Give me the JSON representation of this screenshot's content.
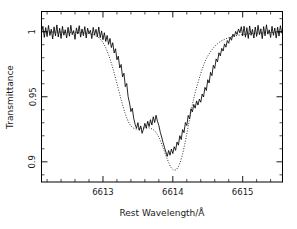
{
  "figure": {
    "background": "#ffffff",
    "foreground": "#000000"
  },
  "chart_data": {
    "type": "line",
    "title": "",
    "subtitle": "",
    "xlabel": "Rest Wavelength/Å",
    "ylabel": "Transmittance",
    "xlim": [
      6612.12,
      6615.57
    ],
    "ylim": [
      0.8845,
      1.0155
    ],
    "grid": false,
    "legend": null,
    "legend_position": "none",
    "xticks": [
      6613,
      6614,
      6615
    ],
    "xticklabels": [
      "6613",
      "6614",
      "6615"
    ],
    "xminor_tick_step": 0.2,
    "yticks": [
      0.9,
      0.95,
      1.0
    ],
    "yticklabels": [
      "0.9",
      "0.95",
      "1"
    ],
    "yminor_tick_step": 0.01,
    "annotations": [],
    "series": [
      {
        "name": "observed spectrum",
        "style": "solid",
        "color": "#000000",
        "x": [
          6612.12,
          6612.14,
          6612.16,
          6612.18,
          6612.2,
          6612.22,
          6612.24,
          6612.26,
          6612.28,
          6612.3,
          6612.32,
          6612.34,
          6612.36,
          6612.38,
          6612.4,
          6612.42,
          6612.44,
          6612.46,
          6612.48,
          6612.5,
          6612.52,
          6612.54,
          6612.56,
          6612.58,
          6612.6,
          6612.62,
          6612.64,
          6612.66,
          6612.68,
          6612.7,
          6612.72,
          6612.74,
          6612.76,
          6612.78,
          6612.8,
          6612.82,
          6612.84,
          6612.86,
          6612.88,
          6612.9,
          6612.92,
          6612.94,
          6612.96,
          6612.98,
          6613.0,
          6613.02,
          6613.04,
          6613.06,
          6613.08,
          6613.1,
          6613.12,
          6613.14,
          6613.16,
          6613.18,
          6613.2,
          6613.22,
          6613.24,
          6613.26,
          6613.28,
          6613.3,
          6613.32,
          6613.34,
          6613.36,
          6613.38,
          6613.4,
          6613.42,
          6613.44,
          6613.46,
          6613.48,
          6613.5,
          6613.52,
          6613.54,
          6613.56,
          6613.58,
          6613.6,
          6613.62,
          6613.64,
          6613.66,
          6613.68,
          6613.7,
          6613.72,
          6613.74,
          6613.76,
          6613.78,
          6613.8,
          6613.82,
          6613.84,
          6613.86,
          6613.88,
          6613.9,
          6613.92,
          6613.94,
          6613.96,
          6613.98,
          6614.0,
          6614.02,
          6614.04,
          6614.06,
          6614.08,
          6614.1,
          6614.12,
          6614.14,
          6614.16,
          6614.18,
          6614.2,
          6614.22,
          6614.24,
          6614.26,
          6614.28,
          6614.3,
          6614.32,
          6614.34,
          6614.36,
          6614.38,
          6614.4,
          6614.42,
          6614.44,
          6614.46,
          6614.48,
          6614.5,
          6614.52,
          6614.54,
          6614.56,
          6614.58,
          6614.6,
          6614.62,
          6614.64,
          6614.66,
          6614.68,
          6614.7,
          6614.72,
          6614.74,
          6614.76,
          6614.78,
          6614.8,
          6614.82,
          6614.84,
          6614.86,
          6614.88,
          6614.9,
          6614.92,
          6614.94,
          6614.96,
          6614.98,
          6615.0,
          6615.02,
          6615.04,
          6615.06,
          6615.08,
          6615.1,
          6615.12,
          6615.14,
          6615.16,
          6615.18,
          6615.2,
          6615.22,
          6615.24,
          6615.26,
          6615.28,
          6615.3,
          6615.32,
          6615.34,
          6615.36,
          6615.38,
          6615.4,
          6615.42,
          6615.44,
          6615.46,
          6615.48,
          6615.5,
          6615.52,
          6615.54,
          6615.56
        ],
        "y": [
          0.9995,
          1.0042,
          0.9956,
          1.0031,
          0.9962,
          1.0048,
          0.9971,
          1.0019,
          0.9944,
          1.0037,
          0.9968,
          1.0052,
          0.9959,
          1.0026,
          0.9948,
          1.0041,
          0.9973,
          1.0015,
          0.9952,
          1.0034,
          0.9965,
          1.0049,
          0.9977,
          1.0008,
          0.9941,
          1.0029,
          0.9982,
          1.0046,
          0.9958,
          1.0021,
          0.9969,
          1.0039,
          0.9951,
          1.0027,
          0.9985,
          1.0011,
          0.9947,
          1.0033,
          0.9974,
          1.0018,
          0.9961,
          1.0036,
          0.9954,
          1.0006,
          0.9938,
          0.9992,
          0.9925,
          0.9971,
          0.9902,
          0.9948,
          0.9878,
          0.9915,
          0.9836,
          0.9869,
          0.9784,
          0.9812,
          0.9721,
          0.9748,
          0.9652,
          0.9681,
          0.9578,
          0.9602,
          0.9501,
          0.9452,
          0.9386,
          0.9412,
          0.9334,
          0.9288,
          0.9258,
          0.9301,
          0.9242,
          0.9276,
          0.9219,
          0.9252,
          0.9296,
          0.9258,
          0.9312,
          0.9271,
          0.9324,
          0.9283,
          0.9346,
          0.9302,
          0.9358,
          0.9312,
          0.9279,
          0.9228,
          0.9191,
          0.9148,
          0.9112,
          0.9076,
          0.9042,
          0.9087,
          0.9051,
          0.9098,
          0.9064,
          0.9116,
          0.9088,
          0.9152,
          0.9128,
          0.9201,
          0.9171,
          0.9248,
          0.9224,
          0.9302,
          0.9279,
          0.9356,
          0.9331,
          0.9408,
          0.9384,
          0.9441,
          0.9412,
          0.9468,
          0.9436,
          0.9482,
          0.9458,
          0.9521,
          0.9498,
          0.9572,
          0.9548,
          0.9631,
          0.9606,
          0.9688,
          0.9662,
          0.9742,
          0.9718,
          0.9791,
          0.9768,
          0.9838,
          0.9814,
          0.9872,
          0.9851,
          0.9906,
          0.9881,
          0.9932,
          0.9911,
          0.9958,
          0.9934,
          0.9981,
          0.9962,
          1.0002,
          0.9978,
          1.0021,
          0.9991,
          1.0038,
          0.9968,
          1.0042,
          0.9958,
          1.0031,
          0.9948,
          1.0044,
          0.9972,
          1.0018,
          0.9951,
          1.0036,
          0.9964,
          1.0049,
          0.9977,
          1.0022,
          0.9946,
          1.0039,
          0.9968,
          1.0053,
          0.9981,
          1.0014,
          0.9955,
          1.0041,
          0.9972,
          1.0028,
          0.9951,
          1.0035,
          0.9966,
          1.0046,
          0.9989
        ]
      },
      {
        "name": "model fit",
        "style": "dotted",
        "color": "#000000",
        "x": [
          6612.12,
          6612.3,
          6612.5,
          6612.7,
          6612.85,
          6612.95,
          6613.02,
          6613.08,
          6613.14,
          6613.2,
          6613.26,
          6613.32,
          6613.38,
          6613.44,
          6613.5,
          6613.56,
          6613.62,
          6613.68,
          6613.74,
          6613.8,
          6613.86,
          6613.92,
          6613.98,
          6614.04,
          6614.1,
          6614.16,
          6614.22,
          6614.3,
          6614.4,
          6614.5,
          6614.65,
          6614.85,
          6615.1,
          6615.35,
          6615.56
        ],
        "y": [
          0.9998,
          0.9997,
          0.9996,
          0.9992,
          0.9978,
          0.9948,
          0.9898,
          0.9822,
          0.9722,
          0.9602,
          0.9478,
          0.9368,
          0.9292,
          0.9258,
          0.9252,
          0.9258,
          0.9262,
          0.9258,
          0.9238,
          0.9188,
          0.9108,
          0.9022,
          0.8952,
          0.8938,
          0.8988,
          0.9108,
          0.9272,
          0.9488,
          0.9678,
          0.9812,
          0.9912,
          0.9962,
          0.9984,
          0.9992,
          0.9996
        ]
      }
    ]
  }
}
